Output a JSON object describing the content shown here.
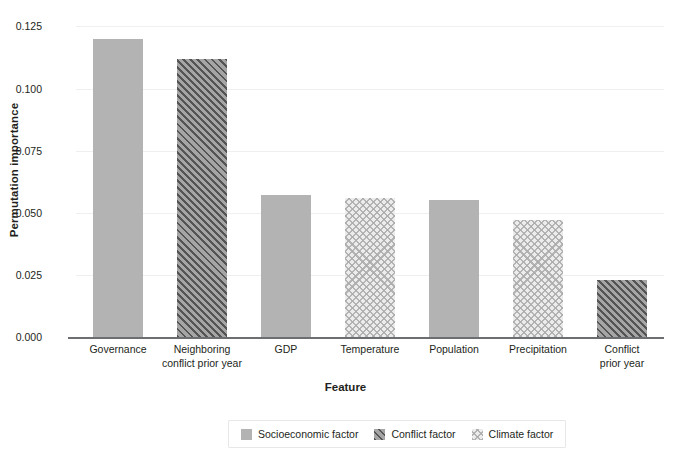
{
  "chart_data": {
    "type": "bar",
    "title": "",
    "xlabel": "Feature",
    "ylabel": "Permutation importance",
    "categories": [
      "Governance",
      "Neighboring conflict prior year",
      "GDP",
      "Temperature",
      "Population",
      "Precipitation",
      "Conflict prior year"
    ],
    "values": [
      0.12,
      0.112,
      0.057,
      0.056,
      0.055,
      0.047,
      0.023
    ],
    "groups": [
      "Socioeconomic factor",
      "Conflict factor",
      "Socioeconomic factor",
      "Climate factor",
      "Socioeconomic factor",
      "Climate factor",
      "Conflict factor"
    ],
    "ylim": [
      0.0,
      0.13
    ],
    "yticks": [
      "0.000",
      "0.025",
      "0.050",
      "0.075",
      "0.100",
      "0.125"
    ],
    "ytick_values": [
      0.0,
      0.025,
      0.05,
      0.075,
      0.1,
      0.125
    ],
    "grid": "horizontal",
    "legend_position": "bottom-center",
    "legend": [
      {
        "label": "Socioeconomic factor",
        "pattern": "solid-gray",
        "color": "#b3b3b3"
      },
      {
        "label": "Conflict factor",
        "pattern": "diagonal-hatch",
        "color": "#808080"
      },
      {
        "label": "Climate factor",
        "pattern": "cross-hatch-light",
        "color": "#d9d9d9"
      }
    ]
  },
  "axis": {
    "y_title": "Permutation importance",
    "x_title": "Feature",
    "tick_labels": {
      "y0": "0.000",
      "y1": "0.025",
      "y2": "0.050",
      "y3": "0.075",
      "y4": "0.100",
      "y5": "0.125"
    }
  },
  "xticks": [
    {
      "line1": "Governance",
      "line2": ""
    },
    {
      "line1": "Neighboring",
      "line2": "conflict prior year"
    },
    {
      "line1": "GDP",
      "line2": ""
    },
    {
      "line1": "Temperature",
      "line2": ""
    },
    {
      "line1": "Population",
      "line2": ""
    },
    {
      "line1": "Precipitation",
      "line2": ""
    },
    {
      "line1": "Conflict",
      "line2": "prior year"
    }
  ],
  "legend_items": [
    {
      "label": "Socioeconomic factor"
    },
    {
      "label": "Conflict factor"
    },
    {
      "label": "Climate factor"
    }
  ]
}
